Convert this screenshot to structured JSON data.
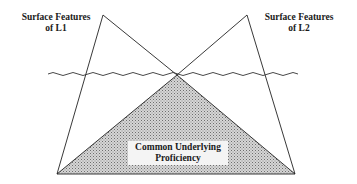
{
  "diagram": {
    "labels": {
      "l1_surface": [
        "Surface Features",
        "of L1"
      ],
      "l2_surface": [
        "Surface Features",
        "of L2"
      ],
      "common": [
        "Common Underlying",
        "Proficiency"
      ]
    },
    "shapes": {
      "left_apex": [
        103,
        15
      ],
      "right_apex": [
        247,
        15
      ],
      "crossing_point": [
        177,
        75
      ],
      "bottom_left": [
        57,
        174
      ],
      "bottom_right": [
        295,
        174
      ],
      "waterline_y": 74,
      "waterline_x_start": 48,
      "waterline_x_end": 302
    },
    "colors": {
      "line": "#222222",
      "shading_fill": "#c8c8c8",
      "shading_dot": "#7a7a7a",
      "background": "#ffffff"
    }
  }
}
